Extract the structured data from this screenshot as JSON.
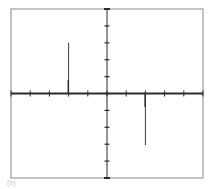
{
  "chart_data": {
    "type": "line",
    "title": "",
    "panel_label": "(b)",
    "xlabel": "",
    "ylabel": "",
    "xlim": [
      -5,
      5
    ],
    "ylim": [
      -5,
      5
    ],
    "x_ticks": [
      -5,
      -4,
      -3,
      -2,
      -1,
      0,
      1,
      2,
      3,
      4,
      5
    ],
    "y_ticks": [
      -5,
      -4,
      -3,
      -2,
      -1,
      0,
      1,
      2,
      3,
      4,
      5
    ],
    "grid": false,
    "legend": "none",
    "series": [
      {
        "name": "positive-impulse",
        "x": -2,
        "y": 3.0
      },
      {
        "name": "negative-impulse",
        "x": 2,
        "y": -3.05
      }
    ],
    "colors": {
      "frame": "#8a8a8a",
      "axis": "#2b2b2b",
      "impulse": "#3a3a3a"
    }
  }
}
